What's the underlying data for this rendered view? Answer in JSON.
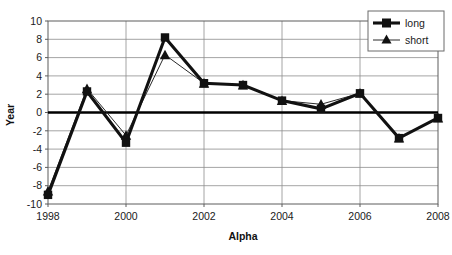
{
  "chart_data": {
    "type": "line",
    "title": "",
    "xlabel": "Alpha",
    "ylabel": "Year",
    "x": [
      1998,
      1999,
      2000,
      2001,
      2002,
      2003,
      2004,
      2005,
      2006,
      2007,
      2008
    ],
    "xtick_labels": [
      "1998",
      "2000",
      "2002",
      "2004",
      "2006",
      "2008"
    ],
    "xtick_values": [
      1998,
      2000,
      2002,
      2004,
      2006,
      2008
    ],
    "ytick_labels": [
      "10",
      "8",
      "6",
      "4",
      "2",
      "0",
      "-2",
      "-4",
      "-6",
      "-8",
      "-10"
    ],
    "ytick_values": [
      10,
      8,
      6,
      4,
      2,
      0,
      -2,
      -4,
      -6,
      -8,
      -10
    ],
    "xlim": [
      1998,
      2008
    ],
    "ylim": [
      -10,
      10
    ],
    "grid": "horizontal-and-vertical",
    "legend_position": "top-right",
    "zero_line": true,
    "series": [
      {
        "name": "long",
        "marker": "square",
        "line_width": "thick",
        "values": [
          -9.0,
          2.3,
          -3.3,
          8.2,
          3.2,
          3.0,
          1.3,
          0.4,
          2.1,
          -2.8,
          -0.6
        ]
      },
      {
        "name": "short",
        "marker": "triangle",
        "line_width": "thin",
        "values": [
          -8.6,
          2.6,
          -2.5,
          6.3,
          3.2,
          3.0,
          1.3,
          0.9,
          2.1,
          -2.8,
          -0.6
        ]
      }
    ]
  },
  "legend": {
    "entries": [
      {
        "label": "long"
      },
      {
        "label": "short"
      }
    ]
  },
  "axes": {
    "x_title": "Alpha",
    "y_title": "Year"
  }
}
